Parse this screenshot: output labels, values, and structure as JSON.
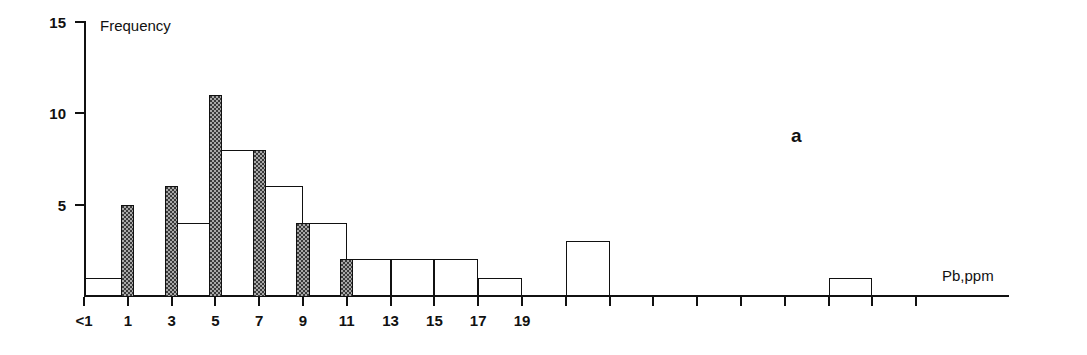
{
  "figure": {
    "panel_label": "a",
    "y_axis_title": "Frequency",
    "x_axis_title": "Pb,ppm"
  },
  "chart_data": {
    "type": "bar",
    "title": "",
    "subtitle": "",
    "panel": "a",
    "xlabel": "Pb,ppm",
    "ylabel": "Frequency",
    "xlim": [
      0,
      19
    ],
    "ylim": [
      0,
      15
    ],
    "grid": false,
    "legend": null,
    "y_ticks": [
      5,
      10,
      15
    ],
    "y_tick_labels": [
      "5",
      "10",
      "15"
    ],
    "x_ticks": [
      0,
      1,
      2,
      3,
      4,
      5,
      6,
      7,
      8,
      9,
      10,
      11,
      12,
      13,
      14,
      15,
      16,
      17,
      18,
      19
    ],
    "x_tick_labels": [
      "<1",
      "",
      "1",
      "",
      "3",
      "",
      "5",
      "",
      "7",
      "",
      "9",
      "",
      "11",
      "",
      "13",
      "",
      "15",
      "",
      "17",
      "",
      "19"
    ],
    "x_labeled_ticks": [
      {
        "value": 0,
        "label": "<1"
      },
      {
        "value": 2,
        "label": "1"
      },
      {
        "value": 4,
        "label": "3"
      },
      {
        "value": 6,
        "label": "5"
      },
      {
        "value": 8,
        "label": "7"
      },
      {
        "value": 10,
        "label": "9"
      },
      {
        "value": 12,
        "label": "11"
      },
      {
        "value": 14,
        "label": "13"
      },
      {
        "value": 16,
        "label": "15"
      },
      {
        "value": 18,
        "label": "17"
      },
      {
        "value": 20,
        "label": "19"
      }
    ],
    "series": [
      {
        "name": "open",
        "style": "outline",
        "fill": "#ffffff",
        "stroke": "#111111",
        "bar_width_units": 1.0,
        "bars": [
          {
            "x_start": 0,
            "x_end": 1,
            "value": 1
          },
          {
            "x_start": 2,
            "x_end": 3,
            "value": 4
          },
          {
            "x_start": 3,
            "x_end": 4,
            "value": 8
          },
          {
            "x_start": 4,
            "x_end": 5,
            "value": 6
          },
          {
            "x_start": 5,
            "x_end": 6,
            "value": 4
          },
          {
            "x_start": 6,
            "x_end": 7,
            "value": 2
          },
          {
            "x_start": 7,
            "x_end": 8,
            "value": 2
          },
          {
            "x_start": 8,
            "x_end": 9,
            "value": 2
          },
          {
            "x_start": 9,
            "x_end": 10,
            "value": 1
          },
          {
            "x_start": 11,
            "x_end": 12,
            "value": 3
          },
          {
            "x_start": 17,
            "x_end": 18,
            "value": 1
          }
        ]
      },
      {
        "name": "shaded",
        "style": "stippled-gray",
        "fill": "#a8a8a8",
        "stroke": "#111111",
        "bar_width_units": 0.3,
        "bars": [
          {
            "center": 1,
            "value": 5
          },
          {
            "center": 2,
            "value": 6
          },
          {
            "center": 3,
            "value": 11
          },
          {
            "center": 4,
            "value": 8
          },
          {
            "center": 5,
            "value": 4
          },
          {
            "center": 6,
            "value": 2
          }
        ]
      }
    ]
  },
  "geometry": {
    "x0_px": 84,
    "y0_px": 296,
    "px_per_x_unit": 43.8,
    "px_per_y_unit": 18.3,
    "plot_top_px": 21
  }
}
